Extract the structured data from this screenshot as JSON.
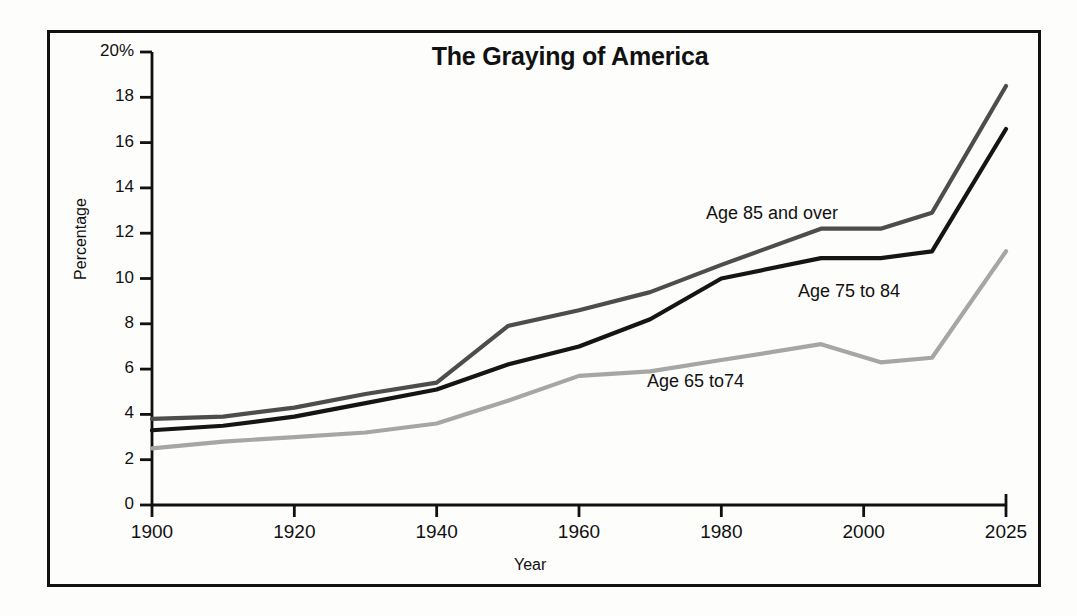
{
  "chart_data": {
    "type": "line",
    "title": "The Graying of America",
    "xlabel": "Year",
    "ylabel": "Percentage",
    "grid": false,
    "legend_position": "inline-annotations",
    "xlim": [
      1900,
      2025
    ],
    "ylim": [
      0,
      20
    ],
    "xticks": [
      "1900",
      "1920",
      "1940",
      "1960",
      "1980",
      "2000",
      "2025"
    ],
    "xtick_values": [
      1900,
      1920,
      1940,
      1960,
      1980,
      2000,
      2025
    ],
    "yticks": [
      "0",
      "2",
      "4",
      "6",
      "8",
      "10",
      "12",
      "14",
      "16",
      "18",
      "20%"
    ],
    "ytick_values": [
      0,
      2,
      4,
      6,
      8,
      10,
      12,
      14,
      16,
      18,
      20
    ],
    "x": [
      1900,
      1910,
      1920,
      1930,
      1940,
      1950,
      1960,
      1970,
      1980,
      1994,
      2003,
      2012,
      2025
    ],
    "series": [
      {
        "name": "Age 85 and over",
        "color": "#4d4d4d",
        "values": [
          3.8,
          3.9,
          4.3,
          4.9,
          5.4,
          7.9,
          8.6,
          9.4,
          10.6,
          12.2,
          12.2,
          12.9,
          18.5
        ]
      },
      {
        "name": "Age 75 to 84",
        "color": "#151515",
        "values": [
          3.3,
          3.5,
          3.9,
          4.5,
          5.1,
          6.2,
          7.0,
          8.2,
          10.0,
          10.9,
          10.9,
          11.2,
          16.6
        ]
      },
      {
        "name": "Age 65 to74",
        "color": "#a6a6a6",
        "values": [
          2.5,
          2.8,
          3.0,
          3.2,
          3.6,
          4.6,
          5.7,
          5.9,
          6.4,
          7.1,
          6.3,
          6.5,
          11.2
        ]
      }
    ],
    "annotations": [
      {
        "text": "Age 85 and over",
        "x_px": 706,
        "y_px": 203
      },
      {
        "text": "Age 75 to 84",
        "x_px": 798,
        "y_px": 281
      },
      {
        "text": "Age 65 to74",
        "x_px": 647,
        "y_px": 371
      }
    ]
  }
}
